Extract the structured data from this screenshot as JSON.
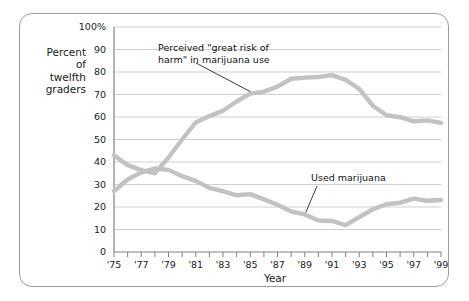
{
  "chart_data": {
    "type": "line",
    "title": "",
    "xlabel": "Year",
    "ylabel": "Percent\nof\ntwelfth\ngraders",
    "ylim": [
      0,
      100
    ],
    "yticks": [
      "0",
      "10",
      "20",
      "30",
      "40",
      "50",
      "60",
      "70",
      "80",
      "90",
      "100%"
    ],
    "ytick_values": [
      0,
      10,
      20,
      30,
      40,
      50,
      60,
      70,
      80,
      90,
      100
    ],
    "xlim": [
      1975,
      1999
    ],
    "xticks": [
      "'75",
      "'77",
      "'79",
      "'81",
      "'83",
      "'85",
      "'87",
      "'89",
      "'91",
      "'93",
      "'95",
      "'97",
      "'99"
    ],
    "xtick_values": [
      1975,
      1977,
      1979,
      1981,
      1983,
      1985,
      1987,
      1989,
      1991,
      1993,
      1995,
      1997,
      1999
    ],
    "minor_tick_values": [
      1976,
      1978,
      1980,
      1982,
      1984,
      1986,
      1988,
      1990,
      1992,
      1994,
      1996,
      1998
    ],
    "grid": true,
    "legend_position": "inline-annotations",
    "x": [
      1975,
      1976,
      1977,
      1978,
      1979,
      1980,
      1981,
      1982,
      1983,
      1984,
      1985,
      1986,
      1987,
      1988,
      1989,
      1990,
      1991,
      1992,
      1993,
      1994,
      1995,
      1996,
      1997,
      1998,
      1999
    ],
    "series": [
      {
        "name": "Perceived \"great risk of harm\" in marijuana use",
        "color": "#c2c2c2",
        "values": [
          43,
          38.6,
          36.4,
          35,
          42,
          50,
          57.6,
          60.4,
          62.8,
          66.9,
          70.4,
          71.3,
          73.5,
          77,
          77.5,
          77.8,
          78.6,
          76.5,
          72.5,
          65,
          60.8,
          59.9,
          58.1,
          58.5,
          57.4
        ]
      },
      {
        "name": "Used marijuana",
        "color": "#c2c2c2",
        "values": [
          27.1,
          32.2,
          35.4,
          37.1,
          36.5,
          33.7,
          31.6,
          28.5,
          27,
          25.2,
          25.7,
          23.4,
          21,
          18,
          16.7,
          14,
          13.8,
          11.9,
          15.5,
          19,
          21.2,
          21.9,
          23.7,
          22.8,
          23.1
        ]
      }
    ],
    "annotations": [
      {
        "name": "risk-annotation",
        "text": "Perceived \"great risk of\nharm\" in marijuana use",
        "point_x": 1985,
        "point_y": 70.4
      },
      {
        "name": "use-annotation",
        "text": "Used marijuana",
        "point_x": 1989,
        "point_y": 16.7
      }
    ]
  },
  "colors": {
    "line": "#c2c2c2",
    "grid": "#d0d0d0",
    "axis": "#808080",
    "frame": "#9c9c9c",
    "text": "#1a1a1a",
    "background": "#ffffff"
  }
}
